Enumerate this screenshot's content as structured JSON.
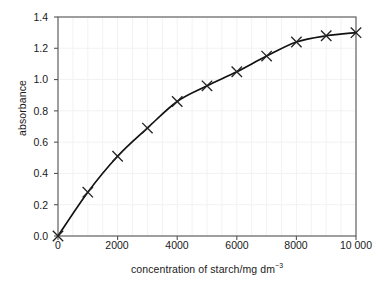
{
  "chart_data": {
    "type": "line",
    "title": "",
    "xlabel_text": "concentration of starch/mg dm",
    "xlabel_sup": "−3",
    "ylabel": "absorbance",
    "x": [
      0,
      1000,
      2000,
      3000,
      4000,
      5000,
      6000,
      7000,
      8000,
      9000,
      10000
    ],
    "values": [
      0.0,
      0.28,
      0.51,
      0.69,
      0.86,
      0.96,
      1.05,
      1.15,
      1.24,
      1.28,
      1.3
    ],
    "series": [
      {
        "name": "absorbance",
        "values": [
          0.0,
          0.28,
          0.51,
          0.69,
          0.86,
          0.96,
          1.05,
          1.15,
          1.24,
          1.28,
          1.3
        ]
      }
    ],
    "xlim": [
      0,
      10000
    ],
    "ylim": [
      0.0,
      1.4
    ],
    "xticks": [
      0,
      2000,
      4000,
      6000,
      8000,
      10000
    ],
    "xticklabels": [
      "0",
      "2000",
      "4000",
      "6000",
      "8000",
      "10 000"
    ],
    "yticks": [
      0.0,
      0.2,
      0.4,
      0.6,
      0.8,
      1.0,
      1.2,
      1.4
    ],
    "yticklabels": [
      "0.0",
      "0.2",
      "0.4",
      "0.6",
      "0.8",
      "1.0",
      "1.2",
      "1.4"
    ],
    "grid": true,
    "grid_color": "#f2f2f4",
    "legend": false,
    "marker": "x-cross",
    "line_color": "#111111",
    "marker_color": "#222222",
    "axis_color": "#555555"
  }
}
